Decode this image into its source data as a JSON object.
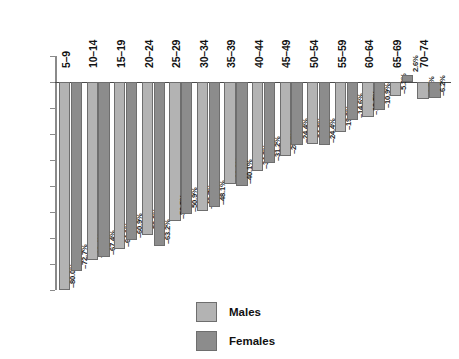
{
  "chart_data": {
    "type": "bar",
    "title": "",
    "xlabel": "",
    "ylabel": "",
    "ylim": [
      -80,
      10
    ],
    "grid": false,
    "legend_position": "bottom-center",
    "categories": [
      "5–9",
      "10–14",
      "15–19",
      "20–24",
      "25–29",
      "30–34",
      "35–39",
      "40–44",
      "45–49",
      "50–54",
      "55–59",
      "60–64",
      "65–69",
      "70–74"
    ],
    "ytick_labels": [
      "10%",
      "0%",
      "–10%",
      "–20%",
      "–30%",
      "–40%",
      "–50%",
      "–60%",
      "–70%",
      "–80%"
    ],
    "ytick_values": [
      10,
      0,
      -10,
      -20,
      -30,
      -40,
      -50,
      -60,
      -70,
      -80
    ],
    "series": [
      {
        "name": "Males",
        "color": "#b3b3b3",
        "values": [
          -80.0,
          -68.4,
          -64.1,
          -59.0,
          -53.5,
          -49.7,
          -39.2,
          -34.2,
          -28.5,
          -24.0,
          -19.3,
          -13.5,
          -5.3,
          -6.5
        ],
        "labels": [
          "–80.0%",
          "–68.4%",
          "–64.1%",
          "–59.0%",
          "–53.5%",
          "–49.7%",
          "–39.2%",
          "–34.2%",
          "–28.5%",
          "–24.0%",
          "–19.3%",
          "–13.5%",
          "–5.3%",
          "–6.5%"
        ]
      },
      {
        "name": "Females",
        "color": "#8c8c8c",
        "values": [
          -72.7,
          -67.4,
          -60.9,
          -63.2,
          -50.9,
          -48.1,
          -40.1,
          -31.2,
          -24.4,
          -24.4,
          -14.6,
          -10.9,
          2.6,
          -6.2
        ],
        "labels": [
          "–72.7%",
          "–67.4%",
          "–60.9%",
          "–63.2%",
          "–50.9%",
          "–48.1%",
          "–40.1%",
          "–31.2%",
          "–24.4%",
          "–24.4%",
          "–14.6%",
          "–10.9%",
          "2.6%",
          "–6.2%"
        ]
      }
    ]
  },
  "legend": {
    "items": [
      {
        "label": "Males",
        "color": "#b3b3b3"
      },
      {
        "label": "Females",
        "color": "#8c8c8c"
      }
    ]
  }
}
